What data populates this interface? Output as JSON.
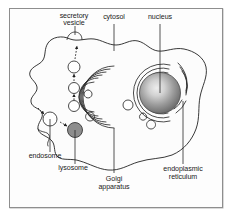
{
  "figure": {
    "background_color": "#ffffff",
    "frame_color": "#8e8e8e"
  },
  "labels": {
    "secretory_vesicle": {
      "line1": "secretory",
      "line2": "vesicle"
    },
    "cytosol": {
      "line1": "cytosol"
    },
    "nucleus": {
      "line1": "nucleus"
    },
    "endoplasmic_reticulum": {
      "line1": "endoplasmic",
      "line2": "reticulum"
    },
    "golgi_apparatus": {
      "line1": "Golgi",
      "line2": "apparatus"
    },
    "lysosome": {
      "line1": "lysosome"
    },
    "endosome": {
      "line1": "endosome"
    }
  },
  "colors": {
    "outline": "#222222",
    "nucleus_center": "#e8e8e8",
    "nucleus_edge": "#6a6a6a",
    "lysosome_fill": "#8d8d8d",
    "vesicle_fill": "#ffffff",
    "cytosol_fill": "#fcfcfc",
    "text": "#1a1a1a"
  },
  "structures": [
    {
      "name": "plasma-membrane",
      "type": "outline"
    },
    {
      "name": "nucleus",
      "type": "sphere"
    },
    {
      "name": "endoplasmic-reticulum",
      "type": "concentric-arcs",
      "arc_count": 5
    },
    {
      "name": "golgi-apparatus",
      "type": "stacked-cisternae",
      "stack_count": 6
    },
    {
      "name": "secretory-vesicle",
      "type": "circle"
    },
    {
      "name": "transport-vesicles",
      "type": "circle-chain",
      "count": 3
    },
    {
      "name": "endosome",
      "type": "circle"
    },
    {
      "name": "lysosome",
      "type": "filled-circle"
    }
  ]
}
